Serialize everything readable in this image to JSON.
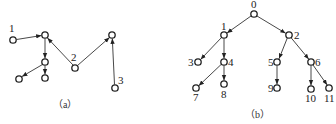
{
  "figure_a": {
    "caption": "（a）",
    "labels": {
      "n1": "1",
      "n2": "2",
      "n3": "3"
    },
    "nodes": [
      {
        "id": "n1",
        "label": "1",
        "x": 13,
        "y": 40
      },
      {
        "id": "top",
        "label": "",
        "x": 45,
        "y": 35
      },
      {
        "id": "mid",
        "label": "",
        "x": 45,
        "y": 62
      },
      {
        "id": "bl",
        "label": "",
        "x": 19,
        "y": 79
      },
      {
        "id": "bm",
        "label": "",
        "x": 45,
        "y": 78
      },
      {
        "id": "n2",
        "label": "2",
        "x": 75,
        "y": 68
      },
      {
        "id": "tr",
        "label": "",
        "x": 112,
        "y": 35
      },
      {
        "id": "n3",
        "label": "3",
        "x": 115,
        "y": 88
      }
    ],
    "edges": [
      [
        "n1",
        "top"
      ],
      [
        "top",
        "mid"
      ],
      [
        "mid",
        "bl"
      ],
      [
        "mid",
        "bm"
      ],
      [
        "n2",
        "top"
      ],
      [
        "n2",
        "tr"
      ],
      [
        "n3",
        "tr"
      ]
    ]
  },
  "figure_b": {
    "caption": "（b）",
    "labels": {
      "n0": "0",
      "n1": "1",
      "n2": "2",
      "n3": "3",
      "n4": "4",
      "n5": "5",
      "n6": "6",
      "n7": "7",
      "n8": "8",
      "n9": "9",
      "n10": "10",
      "n11": "11"
    },
    "nodes": [
      {
        "id": "n0",
        "label": "0",
        "x": 254,
        "y": 14
      },
      {
        "id": "n1",
        "label": "1",
        "x": 224,
        "y": 35
      },
      {
        "id": "n2",
        "label": "2",
        "x": 289,
        "y": 35
      },
      {
        "id": "n3",
        "label": "3",
        "x": 198,
        "y": 62
      },
      {
        "id": "n4",
        "label": "4",
        "x": 224,
        "y": 62
      },
      {
        "id": "n5",
        "label": "5",
        "x": 277,
        "y": 62
      },
      {
        "id": "n6",
        "label": "6",
        "x": 311,
        "y": 62
      },
      {
        "id": "n7",
        "label": "7",
        "x": 196,
        "y": 88
      },
      {
        "id": "n8",
        "label": "8",
        "x": 224,
        "y": 84
      },
      {
        "id": "n9",
        "label": "9",
        "x": 277,
        "y": 88
      },
      {
        "id": "n10",
        "label": "10",
        "x": 311,
        "y": 89
      },
      {
        "id": "n11",
        "label": "11",
        "x": 329,
        "y": 88
      }
    ],
    "edges": [
      [
        "n0",
        "n1"
      ],
      [
        "n0",
        "n2"
      ],
      [
        "n1",
        "n3"
      ],
      [
        "n1",
        "n4"
      ],
      [
        "n2",
        "n5"
      ],
      [
        "n2",
        "n6"
      ],
      [
        "n4",
        "n7"
      ],
      [
        "n4",
        "n8"
      ],
      [
        "n5",
        "n9"
      ],
      [
        "n6",
        "n10"
      ],
      [
        "n6",
        "n11"
      ]
    ]
  }
}
